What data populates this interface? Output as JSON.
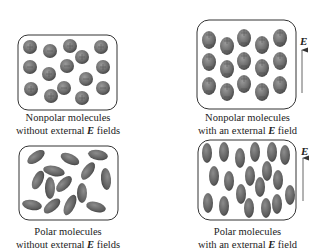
{
  "figure": {
    "panels": [
      {
        "id": "nonpolar-no-field",
        "caption_line1": "Nonpolar molecules",
        "caption_line2_pre": "without external ",
        "caption_line2_sym": "E",
        "caption_line2_post": " fields",
        "molecule_type": "nonpolar (spherical)",
        "field": false
      },
      {
        "id": "nonpolar-with-field",
        "caption_line1": "Nonpolar molecules",
        "caption_line2_pre": "with an external ",
        "caption_line2_sym": "E",
        "caption_line2_post": " field",
        "molecule_type": "nonpolar (induced dipole, aligned)",
        "field": true,
        "field_label": "E"
      },
      {
        "id": "polar-no-field",
        "caption_line1": "Polar molecules",
        "caption_line2_pre": "without external ",
        "caption_line2_sym": "E",
        "caption_line2_post": " fields",
        "molecule_type": "polar (randomly oriented ellipses)",
        "field": false
      },
      {
        "id": "polar-with-field",
        "caption_line1": "Polar molecules",
        "caption_line2_pre": "with an external ",
        "caption_line2_sym": "E",
        "caption_line2_post": " field",
        "molecule_type": "polar (aligned ellipses)",
        "field": true,
        "field_label": "E"
      }
    ],
    "colors": {
      "molecule": "#6e6e6e",
      "molecule_dark": "#4a4a4a",
      "box_stroke": "#333333",
      "text": "#222222"
    }
  }
}
